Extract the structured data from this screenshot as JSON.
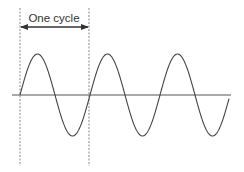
{
  "diagram": {
    "annotation": {
      "label": "One cycle",
      "arrow": "double-headed-arrow"
    },
    "colors": {
      "wave": "#444444",
      "axis": "#555555",
      "guide": "#888888",
      "text": "#333333",
      "background": "#ffffff"
    },
    "wave": {
      "type": "sine",
      "cycles_shown": 3,
      "start_x": 20,
      "end_x": 229,
      "baseline_y": 95,
      "period_px": 70,
      "amplitude_px": 41
    },
    "axis": {
      "x_start": 12,
      "x_end": 231,
      "y": 95
    },
    "guides": {
      "left_x": 20,
      "right_x": 89,
      "y_top": 8,
      "y_bottom": 166
    },
    "arrow_y": 27,
    "label_pos": {
      "x": 54,
      "y": 22
    }
  }
}
